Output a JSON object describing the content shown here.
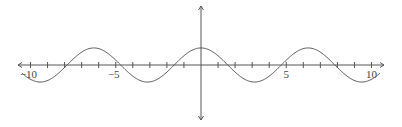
{
  "chart_data": {
    "type": "line",
    "title": "",
    "xlabel": "",
    "ylabel": "",
    "function": "y = cos(x)",
    "xlim": [
      -10.5,
      10.5
    ],
    "ylim": [
      -3.4,
      3.4
    ],
    "grid": false,
    "legend": null,
    "x_ticks": [
      -10,
      -9,
      -8,
      -7,
      -6,
      -5,
      -4,
      -3,
      -2,
      -1,
      0,
      1,
      2,
      3,
      4,
      5,
      6,
      7,
      8,
      9,
      10
    ],
    "x_tick_labels": [
      {
        "value": -10,
        "label": "−10"
      },
      {
        "value": -5,
        "label": "−5"
      },
      {
        "value": 5,
        "label": "5"
      },
      {
        "value": 10,
        "label": "10"
      }
    ],
    "series": [
      {
        "name": "cos(x)",
        "color": "#555555",
        "domain": [
          -10.5,
          10.5
        ],
        "samples": 400
      }
    ]
  },
  "style": {
    "axis_color": "#555555",
    "curve_color": "#555555"
  }
}
